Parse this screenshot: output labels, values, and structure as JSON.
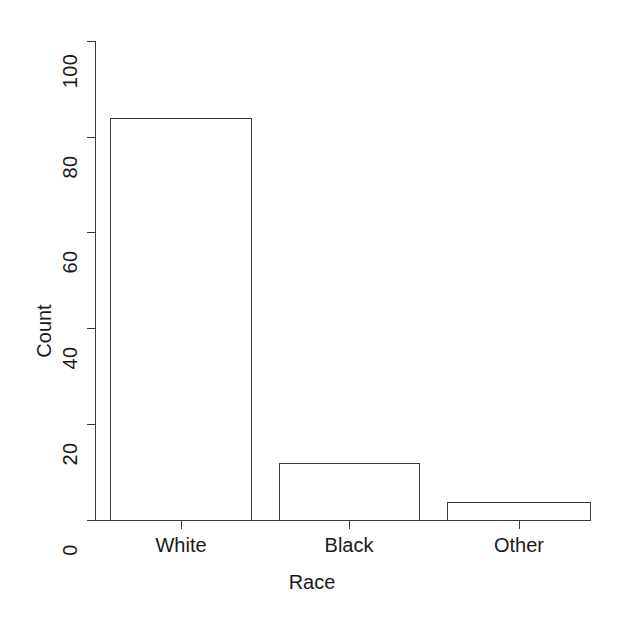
{
  "chart_data": {
    "type": "bar",
    "title": "",
    "subtitle": "",
    "xlabel": "Race",
    "ylabel": "Count",
    "categories": [
      "White",
      "Black",
      "Other"
    ],
    "values": [
      84,
      12,
      4
    ],
    "series": [
      {
        "name": "Count",
        "values": [
          84,
          12,
          4
        ]
      }
    ],
    "ylim": [
      0,
      100
    ],
    "y_ticks": [
      0,
      20,
      40,
      60,
      80,
      100
    ],
    "y_tick_labels": [
      "0",
      "20",
      "40",
      "60",
      "80",
      "100"
    ],
    "x_tick_labels": [
      "White",
      "Black",
      "Other"
    ],
    "grid": false,
    "legend": false,
    "legend_position": "none",
    "bar_fill_color": "#ffffff",
    "bar_border_color": "#3a3a3a",
    "axis_color": "#3a3a3a",
    "background_color": "#ffffff",
    "text_color": "#1a1a1a"
  }
}
